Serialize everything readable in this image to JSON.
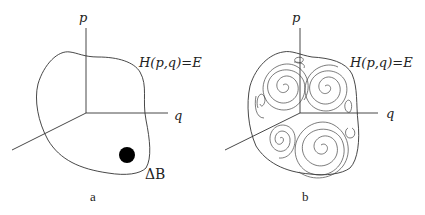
{
  "panels": [
    {
      "id": "a",
      "caption": "a",
      "axes": {
        "p": "p",
        "q": "q"
      },
      "surface_label": "H(p,q)=E",
      "region_label": "ΔB",
      "description": "Energy surface with a small phase-space region ΔB"
    },
    {
      "id": "b",
      "caption": "b",
      "axes": {
        "p": "p",
        "q": "q"
      },
      "surface_label": "H(p,q)=E",
      "description": "Energy surface with region ΔB stretched into filamentary spirals"
    }
  ],
  "colors": {
    "ink": "#222222",
    "background": "#ffffff"
  }
}
